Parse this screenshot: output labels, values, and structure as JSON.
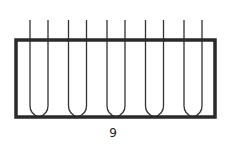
{
  "figure": {
    "caption": "9",
    "tube_count": 5
  },
  "colors": {
    "background": "#ffffff",
    "rack_stroke": "#2a2a2a",
    "tube_stroke": "#333333",
    "label_text": "#222222"
  }
}
